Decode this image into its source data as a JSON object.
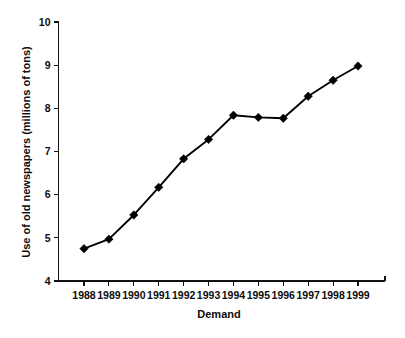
{
  "chart_data": {
    "type": "line",
    "title": "",
    "subtitle": "",
    "xlabel": "Demand",
    "ylabel": "Use of old newspapers (millions of tons)",
    "categories": [
      "1988",
      "1989",
      "1990",
      "1991",
      "1992",
      "1993",
      "1994",
      "1995",
      "1996",
      "1997",
      "1998",
      "1999"
    ],
    "values": [
      4.75,
      4.97,
      5.53,
      6.17,
      6.83,
      7.28,
      7.84,
      7.79,
      7.77,
      8.28,
      8.65,
      8.98
    ],
    "series": [
      {
        "name": "Use of old newspapers",
        "values": [
          4.75,
          4.97,
          5.53,
          6.17,
          6.83,
          7.28,
          7.84,
          7.79,
          7.77,
          8.28,
          8.65,
          8.98
        ]
      }
    ],
    "x_tick_labels": [
      "1988",
      "1989",
      "1990",
      "1991",
      "1992",
      "1993",
      "1994",
      "1995",
      "1996",
      "1997",
      "1998",
      "1999"
    ],
    "y_tick_labels": [
      "4",
      "5",
      "6",
      "7",
      "8",
      "9",
      "10"
    ],
    "y_ticks": [
      4,
      5,
      6,
      7,
      8,
      9,
      10
    ],
    "ylim": [
      4,
      10
    ],
    "grid": false,
    "legend": false,
    "legend_position": "none",
    "marker": "diamond",
    "line_color": "#000000",
    "marker_color": "#000000",
    "background_color": "#ffffff",
    "text_color": "#0d0d0d"
  },
  "axis": {
    "x_title": "Demand",
    "y_title": "Use of old newspapers (millions of tons)"
  }
}
